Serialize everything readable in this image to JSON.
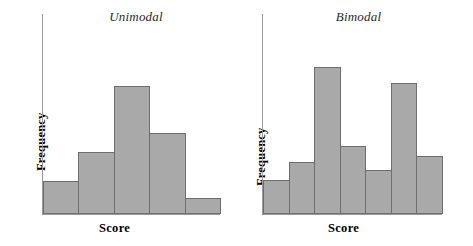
{
  "figure": {
    "width": 473,
    "height": 246,
    "background": "#ffffff",
    "bar_fill": "#a9a9a9",
    "bar_stroke": "#6e6e6e",
    "axis_color": "#9a9a9a"
  },
  "chart_data": [
    {
      "type": "bar",
      "title": "Unimodal",
      "xlabel": "Score",
      "ylabel": "Frequency",
      "categories": [
        "1",
        "2",
        "3",
        "4",
        "5"
      ],
      "values": [
        33,
        62,
        129,
        81,
        16
      ],
      "ylim": [
        0,
        201
      ],
      "xlim": [
        0,
        5
      ],
      "grid": false,
      "legend": false,
      "axis_ticks": false,
      "tick_labels": [],
      "bar_fill": "#a9a9a9",
      "bar_stroke": "#6e6e6e"
    },
    {
      "type": "bar",
      "title": "Bimodal",
      "xlabel": "Score",
      "ylabel": "Frequency",
      "categories": [
        "1",
        "2",
        "3",
        "4",
        "5",
        "6",
        "7"
      ],
      "values": [
        34,
        52,
        148,
        68,
        44,
        132,
        58
      ],
      "ylim": [
        0,
        201
      ],
      "xlim": [
        0,
        7
      ],
      "grid": false,
      "legend": false,
      "axis_ticks": false,
      "tick_labels": [],
      "bar_fill": "#a9a9a9",
      "bar_stroke": "#6e6e6e"
    }
  ]
}
